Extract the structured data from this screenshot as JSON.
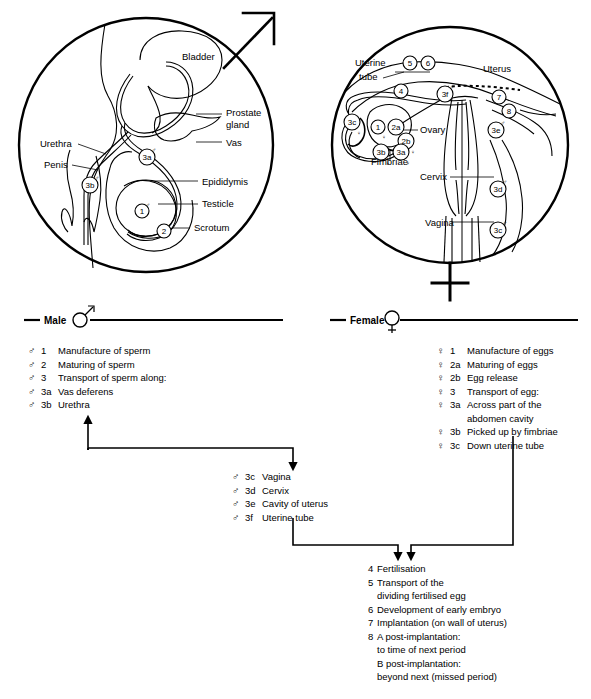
{
  "figure": {
    "line_color": "#000000",
    "background": "#ffffff"
  },
  "male_diagram": {
    "symbol_name": "mars-symbol",
    "labels": [
      {
        "id": "bladder",
        "text": "Bladder",
        "x": 182,
        "y": 60
      },
      {
        "id": "prostate-gland-1",
        "text": "Prostate",
        "x": 226,
        "y": 116
      },
      {
        "id": "prostate-gland-2",
        "text": "gland",
        "x": 226,
        "y": 128
      },
      {
        "id": "vas",
        "text": "Vas",
        "x": 226,
        "y": 146
      },
      {
        "id": "urethra",
        "text": "Urethra",
        "x": 40,
        "y": 147
      },
      {
        "id": "penis",
        "text": "Penis",
        "x": 44,
        "y": 168
      },
      {
        "id": "epididymis",
        "text": "Epididymis",
        "x": 202,
        "y": 185
      },
      {
        "id": "testicle",
        "text": "Testicle",
        "x": 202,
        "y": 207
      },
      {
        "id": "scrotum",
        "text": "Scrotum",
        "x": 194,
        "y": 231
      }
    ],
    "markers": [
      {
        "id": "marker-3a",
        "text": "3a",
        "sym": "♂",
        "x": 147,
        "y": 157
      },
      {
        "id": "marker-3b",
        "text": "3b",
        "sym": "♂",
        "x": 90,
        "y": 185
      },
      {
        "id": "marker-1",
        "text": "1",
        "sym": "♂",
        "x": 142,
        "y": 211
      },
      {
        "id": "marker-2",
        "text": "2",
        "sym": "♂",
        "x": 164,
        "y": 231
      }
    ]
  },
  "female_diagram": {
    "symbol_name": "venus-symbol",
    "labels": [
      {
        "id": "uterine-tube-1",
        "text": "Uterine",
        "x": 355,
        "y": 66
      },
      {
        "id": "uterine-tube-2",
        "text": "tube",
        "x": 359,
        "y": 80
      },
      {
        "id": "uterus",
        "text": "Uterus",
        "x": 483,
        "y": 72
      },
      {
        "id": "ovary",
        "text": "Ovary",
        "x": 420,
        "y": 133
      },
      {
        "id": "fimbriae",
        "text": "Fimbriae",
        "x": 371,
        "y": 165
      },
      {
        "id": "cervix",
        "text": "Cervix",
        "x": 420,
        "y": 180
      },
      {
        "id": "vagina",
        "text": "Vagina",
        "x": 425,
        "y": 226
      }
    ],
    "markers": [
      {
        "id": "marker-5",
        "text": "5",
        "sym": "",
        "x": 410,
        "y": 63
      },
      {
        "id": "marker-6",
        "text": "6",
        "sym": "",
        "x": 428,
        "y": 63
      },
      {
        "id": "marker-4",
        "text": "4",
        "sym": "",
        "x": 401,
        "y": 91
      },
      {
        "id": "marker-3f",
        "text": "3f",
        "sym": "♂",
        "x": 445,
        "y": 94
      },
      {
        "id": "marker-7",
        "text": "7",
        "sym": "",
        "x": 499,
        "y": 97
      },
      {
        "id": "marker-8",
        "text": "8",
        "sym": "",
        "x": 509,
        "y": 111
      },
      {
        "id": "marker-3c-left",
        "text": "3c",
        "sym": "♀",
        "x": 352,
        "y": 122
      },
      {
        "id": "marker-1",
        "text": "1",
        "sym": "♀",
        "x": 378,
        "y": 127
      },
      {
        "id": "marker-2a",
        "text": "2a",
        "sym": "♀",
        "x": 396,
        "y": 127
      },
      {
        "id": "marker-2b",
        "text": "2b",
        "sym": "♀",
        "x": 406,
        "y": 141
      },
      {
        "id": "marker-3e",
        "text": "3e",
        "sym": "♂",
        "x": 496,
        "y": 130
      },
      {
        "id": "marker-3b",
        "text": "3b",
        "sym": "♀",
        "x": 381,
        "y": 152
      },
      {
        "id": "marker-3a",
        "text": "3a",
        "sym": "♀",
        "x": 401,
        "y": 152
      },
      {
        "id": "marker-3d",
        "text": "3d",
        "sym": "♂",
        "x": 498,
        "y": 189
      },
      {
        "id": "marker-3c-vagina",
        "text": "3c",
        "sym": "♂",
        "x": 498,
        "y": 230
      }
    ]
  },
  "male_section": {
    "header_label": "Male",
    "header_symbol": "♂",
    "items": [
      {
        "sym": "♂",
        "num": "1",
        "text": "Manufacture of sperm"
      },
      {
        "sym": "♂",
        "num": "2",
        "text": "Maturing of sperm"
      },
      {
        "sym": "♂",
        "num": "3",
        "text": "Transport of sperm along:"
      },
      {
        "sym": "♂",
        "num": "3a",
        "text": "Vas deferens"
      },
      {
        "sym": "♂",
        "num": "3b",
        "text": "Urethra"
      }
    ]
  },
  "female_section": {
    "header_label": "Female",
    "header_symbol": "♀",
    "items": [
      {
        "sym": "♀",
        "num": "1",
        "text": "Manufacture of eggs"
      },
      {
        "sym": "♀",
        "num": "2a",
        "text": "Maturing of eggs"
      },
      {
        "sym": "♀",
        "num": "2b",
        "text": "Egg release"
      },
      {
        "sym": "♀",
        "num": "3",
        "text": "Transport of egg:"
      },
      {
        "sym": "♀",
        "num": "3a",
        "text": "Across part of the"
      },
      {
        "sym": "",
        "num": "",
        "text": "abdomen cavity"
      },
      {
        "sym": "♀",
        "num": "3b",
        "text": "Picked up by fimbriae"
      },
      {
        "sym": "♀",
        "num": "3c",
        "text": "Down uterine tube"
      }
    ]
  },
  "middle_section": {
    "items": [
      {
        "sym": "♂",
        "num": "3c",
        "text": "Vagina"
      },
      {
        "sym": "♂",
        "num": "3d",
        "text": "Cervix"
      },
      {
        "sym": "♂",
        "num": "3e",
        "text": "Cavity of uterus"
      },
      {
        "sym": "♂",
        "num": "3f",
        "text": "Uterine tube"
      }
    ]
  },
  "bottom_section": {
    "items": [
      {
        "num": "4",
        "text": "Fertilisation"
      },
      {
        "num": "5",
        "text": "Transport of the"
      },
      {
        "num": "",
        "text": "dividing fertilised egg"
      },
      {
        "num": "6",
        "text": "Development of early embryo"
      },
      {
        "num": "7",
        "text": "Implantation (on wall of uterus)"
      },
      {
        "num": "8",
        "text": "A post-implantation:"
      },
      {
        "num": "",
        "text": "to time of next period"
      },
      {
        "num": "",
        "text": "B post-implantation:"
      },
      {
        "num": "",
        "text": "beyond next (missed period)"
      }
    ]
  }
}
